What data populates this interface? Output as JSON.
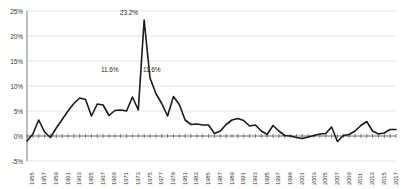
{
  "chart_data": {
    "type": "line",
    "title": "",
    "xlabel": "",
    "ylabel": "",
    "ylim": [
      -5,
      25
    ],
    "ytick_labels": [
      "25%",
      "20%",
      "15%",
      "10%",
      "5%",
      "0%",
      "-5%"
    ],
    "ytick_values": [
      25,
      20,
      15,
      10,
      5,
      0,
      -5
    ],
    "grid": true,
    "legend": "none",
    "line_color": "#1a1a1a",
    "gridline_color": "#d4d4d4",
    "axis_color": "#6e6e6e",
    "xtick_labels": [
      "1955",
      "1957",
      "1959",
      "1961",
      "1963",
      "1965",
      "1967",
      "1969",
      "1971",
      "1973",
      "1975",
      "1977",
      "1979",
      "1981",
      "1983",
      "1985",
      "1987",
      "1989",
      "1991",
      "1993",
      "1995",
      "1997",
      "1999",
      "2001",
      "2003",
      "2005",
      "2007",
      "2009",
      "2011",
      "2013",
      "2015",
      "2017"
    ],
    "x": [
      1955,
      1956,
      1957,
      1958,
      1959,
      1960,
      1961,
      1962,
      1963,
      1964,
      1965,
      1966,
      1967,
      1968,
      1969,
      1970,
      1971,
      1972,
      1973,
      1974,
      1975,
      1976,
      1977,
      1978,
      1979,
      1980,
      1981,
      1982,
      1983,
      1984,
      1985,
      1986,
      1987,
      1988,
      1989,
      1990,
      1991,
      1992,
      1993,
      1994,
      1995,
      1996,
      1997,
      1998,
      1999,
      2000,
      2001,
      2002,
      2003,
      2004,
      2005,
      2006,
      2007,
      2008,
      2009,
      2010,
      2011,
      2012,
      2013,
      2014,
      2015,
      2016,
      2017,
      2018
    ],
    "values": [
      -1.0,
      0.4,
      3.2,
      0.8,
      -0.3,
      1.6,
      3.3,
      5.0,
      6.5,
      7.6,
      7.3,
      4.0,
      6.4,
      6.2,
      4.1,
      5.1,
      5.2,
      5.0,
      7.8,
      5.2,
      23.2,
      11.6,
      8.5,
      6.5,
      4.0,
      7.9,
      6.3,
      3.2,
      2.3,
      2.4,
      2.2,
      2.2,
      0.5,
      1.0,
      2.3,
      3.2,
      3.5,
      3.1,
      2.0,
      2.2,
      1.0,
      0.3,
      2.1,
      1.0,
      0.1,
      0.0,
      -0.3,
      -0.5,
      -0.2,
      0.1,
      0.4,
      0.5,
      1.8,
      -1.1,
      0.1,
      0.3,
      1.0,
      2.1,
      2.9,
      1.0,
      0.4,
      0.6,
      1.3,
      1.3
    ],
    "annotations": [
      {
        "label": "11.6%",
        "x_px": 101,
        "y_px": 66
      },
      {
        "label": "23.2%",
        "x_px": 120,
        "y_px": 9
      },
      {
        "label": "11.6%",
        "x_px": 143,
        "y_px": 66
      }
    ]
  }
}
